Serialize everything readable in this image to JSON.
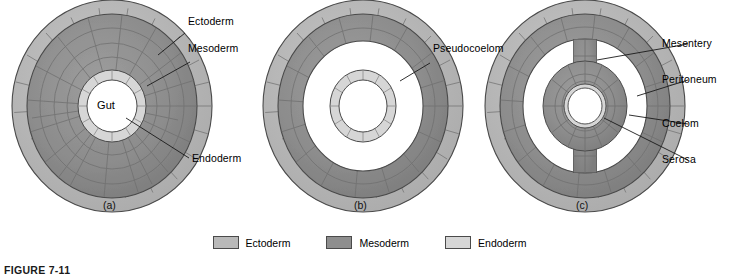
{
  "figure": {
    "caption_partial": "FIGURE 7-11",
    "background": "#ffffff"
  },
  "colors": {
    "ectoderm": "#b9b9b9",
    "mesoderm": "#8e8e8e",
    "endoderm": "#d6d6d6",
    "cavity": "#ffffff",
    "outline": "#4a4a4a",
    "cell_line": "#6f6f6f",
    "leader": "#1a1a1a",
    "text": "#000000"
  },
  "panels": [
    {
      "id": "a",
      "caption": "(a)",
      "center_label": "Gut",
      "cavity_type": "none",
      "labels": [
        {
          "text": "Ectoderm",
          "target": "outer-ectoderm-ring"
        },
        {
          "text": "Mesoderm",
          "target": "mesoderm-layer"
        },
        {
          "text": "Endoderm",
          "target": "endoderm-gut-lining"
        }
      ]
    },
    {
      "id": "b",
      "caption": "(b)",
      "center_label": "",
      "cavity_type": "pseudocoelom",
      "labels": [
        {
          "text": "Pseudocoelom",
          "target": "pseudocoelom-cavity"
        }
      ]
    },
    {
      "id": "c",
      "caption": "(c)",
      "center_label": "",
      "cavity_type": "coelom",
      "labels": [
        {
          "text": "Mesentery",
          "target": "mesentery-bridge"
        },
        {
          "text": "Peritoneum",
          "target": "peritoneum-lining"
        },
        {
          "text": "Coelom",
          "target": "coelom-cavity"
        },
        {
          "text": "Serosa",
          "target": "serosa-lining"
        }
      ]
    }
  ],
  "legend": {
    "items": [
      {
        "label": "Ectoderm",
        "color": "#b9b9b9"
      },
      {
        "label": "Mesoderm",
        "color": "#8e8e8e"
      },
      {
        "label": "Endoderm",
        "color": "#d6d6d6"
      }
    ]
  }
}
